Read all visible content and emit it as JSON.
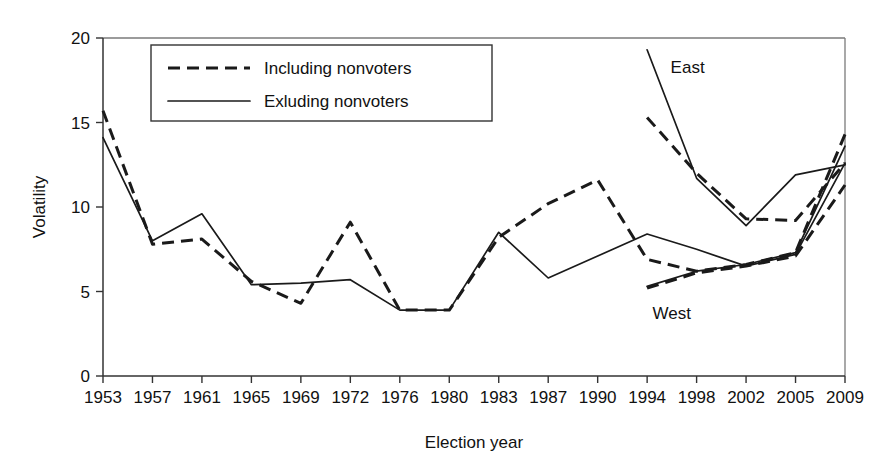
{
  "chart_data": {
    "type": "line",
    "title": "",
    "xlabel": "Election year",
    "ylabel": "Volatility",
    "categories": [
      "1953",
      "1957",
      "1961",
      "1965",
      "1969",
      "1972",
      "1976",
      "1980",
      "1983",
      "1987",
      "1990",
      "1994",
      "1998",
      "2002",
      "2005",
      "2009"
    ],
    "x_tick_labels": [
      "1953",
      "1957",
      "1961",
      "1965",
      "1969",
      "1972",
      "1976",
      "1980",
      "1983",
      "1987",
      "1990",
      "1994",
      "1998",
      "2002",
      "2005",
      "2009"
    ],
    "y_tick_labels": [
      "0",
      "5",
      "10",
      "15",
      "20"
    ],
    "y_ticks": [
      0,
      5,
      10,
      15,
      20
    ],
    "ylim": [
      0,
      20
    ],
    "grid": false,
    "legend_position": "top-left-inside",
    "legend_entries": [
      {
        "label": "Including nonvoters",
        "style": "dashed"
      },
      {
        "label": "Exluding nonvoters",
        "style": "solid"
      }
    ],
    "annotations": [
      {
        "text": "East",
        "x_year": "1998",
        "y_value": 17.9
      },
      {
        "text": "West",
        "x_year": "1998",
        "y_value": 3.4
      }
    ],
    "series": [
      {
        "name": "Including nonvoters",
        "region": "All / West",
        "style": "dashed",
        "x": [
          "1953",
          "1957",
          "1961",
          "1965",
          "1969",
          "1972",
          "1976",
          "1980",
          "1983",
          "1987",
          "1990",
          "1994",
          "1998",
          "2002",
          "2005",
          "2009"
        ],
        "values": [
          15.7,
          7.8,
          8.1,
          5.6,
          4.3,
          9.1,
          3.9,
          3.9,
          8.2,
          10.2,
          11.6,
          6.9,
          6.2,
          6.6,
          7.3,
          14.3
        ]
      },
      {
        "name": "Exluding nonvoters",
        "region": "All / West",
        "style": "solid",
        "x": [
          "1953",
          "1957",
          "1961",
          "1965",
          "1969",
          "1972",
          "1976",
          "1980",
          "1983",
          "1987",
          "1990",
          "1994",
          "1998",
          "2002",
          "2005",
          "2009"
        ],
        "values": [
          14.1,
          8.0,
          9.6,
          5.4,
          5.5,
          5.7,
          3.9,
          3.9,
          8.5,
          5.8,
          7.1,
          8.4,
          7.5,
          6.5,
          7.2,
          12.6
        ]
      },
      {
        "name": "Including nonvoters - East",
        "region": "East",
        "style": "dashed",
        "x": [
          "1994",
          "1998",
          "2002",
          "2005",
          "2009"
        ],
        "values": [
          15.3,
          12.0,
          9.3,
          9.2,
          12.6
        ]
      },
      {
        "name": "Exluding nonvoters - East",
        "region": "East",
        "style": "solid",
        "x": [
          "1994",
          "1998",
          "2002",
          "2005",
          "2009"
        ],
        "values": [
          19.3,
          11.7,
          8.9,
          11.9,
          12.5
        ]
      },
      {
        "name": "Including nonvoters - West",
        "region": "West",
        "style": "dashed",
        "x": [
          "1994",
          "1998",
          "2002",
          "2005",
          "2009"
        ],
        "values": [
          5.2,
          6.1,
          6.5,
          7.1,
          11.3
        ]
      },
      {
        "name": "Exluding nonvoters - West",
        "region": "West",
        "style": "solid",
        "x": [
          "1994",
          "1998",
          "2002",
          "2005",
          "2009"
        ],
        "values": [
          5.3,
          6.2,
          6.6,
          7.3,
          13.6
        ]
      }
    ]
  },
  "axes": {
    "y_label": "Volatility",
    "x_label": "Election year"
  },
  "legend": {
    "item1_label": "Including nonvoters",
    "item2_label": "Exluding nonvoters"
  },
  "annotations": {
    "east_label": "East",
    "west_label": "West"
  }
}
